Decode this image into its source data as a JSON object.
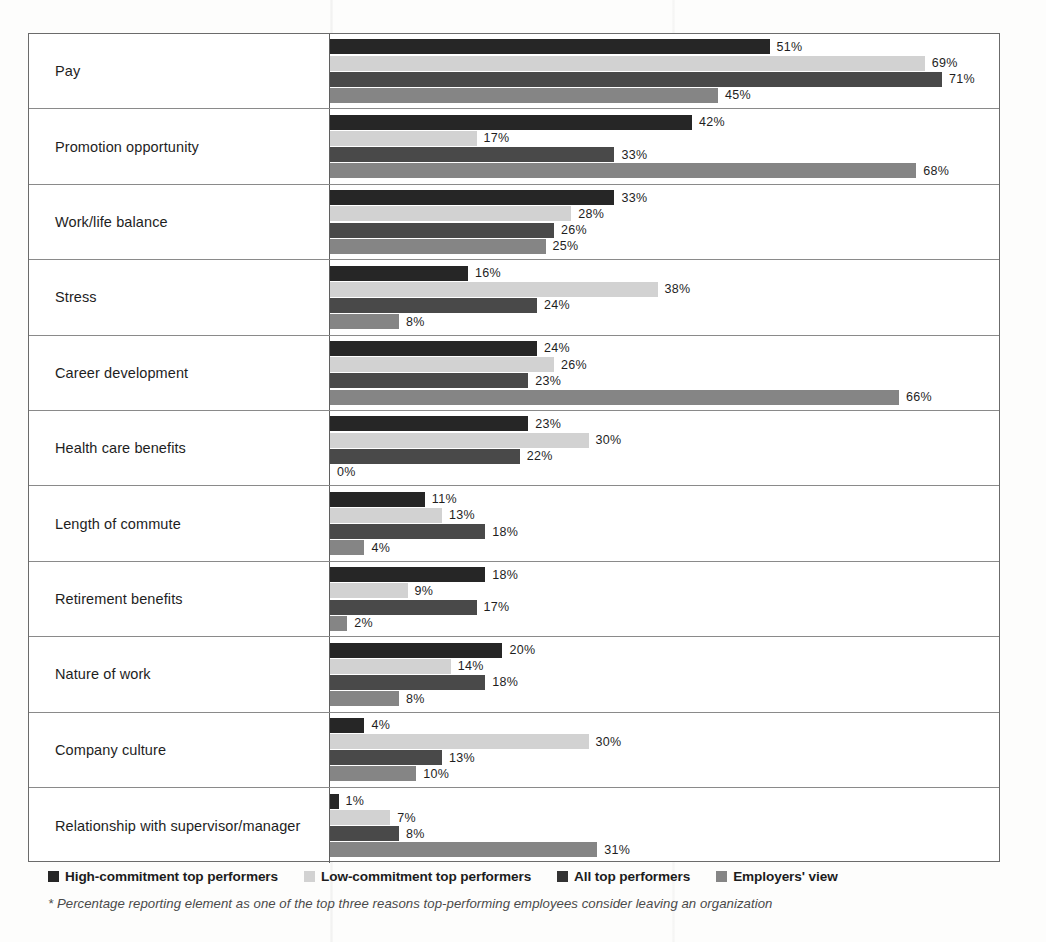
{
  "chart_data": {
    "type": "bar",
    "orientation": "horizontal",
    "title": "",
    "xlabel": "",
    "ylabel": "",
    "xlim": [
      0,
      100
    ],
    "grid": false,
    "legend_position": "bottom-left",
    "value_suffix": "%",
    "categories": [
      "Pay",
      "Promotion opportunity",
      "Work/life balance",
      "Stress",
      "Career development",
      "Health care benefits",
      "Length of commute",
      "Retirement benefits",
      "Nature of work",
      "Company culture",
      "Relationship with supervisor/manager"
    ],
    "series": [
      {
        "name": "High-commitment top performers",
        "color": "#262626",
        "values": [
          51,
          42,
          33,
          16,
          24,
          23,
          11,
          18,
          20,
          4,
          1
        ]
      },
      {
        "name": "Low-commitment top performers",
        "color": "#d2d2d2",
        "values": [
          69,
          17,
          28,
          38,
          26,
          30,
          13,
          9,
          14,
          30,
          7
        ]
      },
      {
        "name": "All top performers",
        "color": "#494949",
        "values": [
          71,
          33,
          26,
          24,
          23,
          22,
          18,
          17,
          18,
          13,
          8
        ]
      },
      {
        "name": "Employers' view",
        "color": "#858585",
        "values": [
          45,
          68,
          25,
          8,
          66,
          0,
          4,
          2,
          8,
          10,
          31
        ]
      }
    ],
    "value_labels": [
      [
        "51%",
        "69%",
        "71%",
        "45%"
      ],
      [
        "42%",
        "17%",
        "33%",
        "68%"
      ],
      [
        "33%",
        "28%",
        "26%",
        "25%"
      ],
      [
        "16%",
        "38%",
        "24%",
        "8%"
      ],
      [
        "24%",
        "26%",
        "23%",
        "66%"
      ],
      [
        "23%",
        "30%",
        "22%",
        "0%"
      ],
      [
        "11%",
        "13%",
        "18%",
        "4%"
      ],
      [
        "18%",
        "9%",
        "17%",
        "2%"
      ],
      [
        "20%",
        "14%",
        "18%",
        "8%"
      ],
      [
        "4%",
        "30%",
        "13%",
        "10%"
      ],
      [
        "1%",
        "7%",
        "8%",
        "31%"
      ]
    ],
    "footnote": "* Percentage reporting element as one of the top three reasons top-performing employees consider leaving an organization"
  },
  "legend": {
    "items": [
      {
        "label": "High-commitment top performers",
        "color": "#262626"
      },
      {
        "label": "Low-commitment top performers",
        "color": "#d2d2d2"
      },
      {
        "label": "All top performers",
        "color": "#333333"
      },
      {
        "label": "Employers' view",
        "color": "#858585"
      }
    ]
  },
  "footnote_text": "* Percentage reporting element as one of the top three reasons top-performing employees consider leaving an organization"
}
